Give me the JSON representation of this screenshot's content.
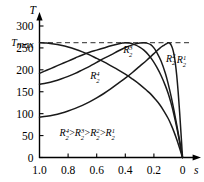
{
  "chart_data": {
    "type": "line",
    "title": "",
    "xlabel": "s",
    "ylabel": "T",
    "xlim": [
      1.0,
      0.0
    ],
    "x_reversed": true,
    "ylim": [
      0,
      320
    ],
    "grid": false,
    "legend": "R₂⁴ > R₂³ > R₂² > R₂¹",
    "xticks": [
      "1.0",
      "0.8",
      "0.6",
      "0.4",
      "0.2",
      "0"
    ],
    "xtick_values": [
      1.0,
      0.8,
      0.6,
      0.4,
      0.2,
      0.0
    ],
    "yticks": [
      "0",
      "50",
      "100",
      "150",
      "200",
      "250",
      "300"
    ],
    "ytick_values": [
      0,
      50,
      100,
      150,
      200,
      250,
      300
    ],
    "annotations": [
      {
        "name": "tmax-line",
        "label": "T",
        "sub": "max",
        "value": 262,
        "style": "dashed-horizontal"
      }
    ],
    "series": [
      {
        "name": "R2_1",
        "label": "R",
        "sub": "2",
        "sup": "1",
        "label_x": 0.04,
        "label_y": 215,
        "points": [
          [
            1.0,
            92
          ],
          [
            0.95,
            94
          ],
          [
            0.9,
            97
          ],
          [
            0.85,
            101
          ],
          [
            0.8,
            106
          ],
          [
            0.75,
            112
          ],
          [
            0.7,
            119
          ],
          [
            0.65,
            127
          ],
          [
            0.6,
            136
          ],
          [
            0.55,
            146
          ],
          [
            0.5,
            157
          ],
          [
            0.45,
            169
          ],
          [
            0.4,
            181
          ],
          [
            0.35,
            194
          ],
          [
            0.3,
            208
          ],
          [
            0.25,
            222
          ],
          [
            0.2,
            237
          ],
          [
            0.16,
            249
          ],
          [
            0.13,
            256
          ],
          [
            0.11,
            260
          ],
          [
            0.1,
            262
          ],
          [
            0.09,
            261
          ],
          [
            0.08,
            257
          ],
          [
            0.07,
            249
          ],
          [
            0.06,
            236
          ],
          [
            0.05,
            215
          ],
          [
            0.04,
            186
          ],
          [
            0.03,
            148
          ],
          [
            0.02,
            103
          ],
          [
            0.01,
            53
          ],
          [
            0.0,
            0
          ]
        ]
      },
      {
        "name": "R2_2",
        "label": "R",
        "sub": "2",
        "sup": "2",
        "label_x": 0.115,
        "label_y": 218,
        "points": [
          [
            1.0,
            167
          ],
          [
            0.95,
            170
          ],
          [
            0.9,
            174
          ],
          [
            0.85,
            179
          ],
          [
            0.8,
            185
          ],
          [
            0.75,
            192
          ],
          [
            0.7,
            200
          ],
          [
            0.65,
            208
          ],
          [
            0.6,
            217
          ],
          [
            0.55,
            226
          ],
          [
            0.5,
            234
          ],
          [
            0.45,
            243
          ],
          [
            0.4,
            251
          ],
          [
            0.35,
            257
          ],
          [
            0.3,
            261
          ],
          [
            0.27,
            262
          ],
          [
            0.25,
            261
          ],
          [
            0.22,
            257
          ],
          [
            0.2,
            250
          ],
          [
            0.18,
            240
          ],
          [
            0.15,
            220
          ],
          [
            0.12,
            192
          ],
          [
            0.1,
            168
          ],
          [
            0.08,
            140
          ],
          [
            0.06,
            108
          ],
          [
            0.04,
            74
          ],
          [
            0.02,
            38
          ],
          [
            0.0,
            0
          ]
        ]
      },
      {
        "name": "R2_3",
        "label": "R",
        "sub": "2",
        "sup": "3",
        "label_x": 0.415,
        "label_y": 238,
        "points": [
          [
            1.0,
            192
          ],
          [
            0.95,
            199
          ],
          [
            0.9,
            206
          ],
          [
            0.85,
            213
          ],
          [
            0.8,
            220
          ],
          [
            0.75,
            227
          ],
          [
            0.7,
            234
          ],
          [
            0.65,
            240
          ],
          [
            0.6,
            245
          ],
          [
            0.55,
            250
          ],
          [
            0.5,
            255
          ],
          [
            0.45,
            259
          ],
          [
            0.42,
            261
          ],
          [
            0.4,
            262
          ],
          [
            0.37,
            261
          ],
          [
            0.34,
            258
          ],
          [
            0.3,
            252
          ],
          [
            0.27,
            245
          ],
          [
            0.24,
            235
          ],
          [
            0.21,
            222
          ],
          [
            0.18,
            206
          ],
          [
            0.15,
            187
          ],
          [
            0.12,
            164
          ],
          [
            0.1,
            146
          ],
          [
            0.08,
            124
          ],
          [
            0.06,
            98
          ],
          [
            0.04,
            68
          ],
          [
            0.02,
            35
          ],
          [
            0.0,
            0
          ]
        ]
      },
      {
        "name": "R2_4",
        "label": "R",
        "sub": "2",
        "sup": "4",
        "label_x": 0.645,
        "label_y": 178,
        "points": [
          [
            1.0,
            262
          ],
          [
            0.95,
            261
          ],
          [
            0.9,
            259
          ],
          [
            0.85,
            256
          ],
          [
            0.8,
            252
          ],
          [
            0.75,
            247
          ],
          [
            0.7,
            241
          ],
          [
            0.65,
            234
          ],
          [
            0.6,
            226
          ],
          [
            0.55,
            218
          ],
          [
            0.5,
            209
          ],
          [
            0.45,
            200
          ],
          [
            0.4,
            190
          ],
          [
            0.35,
            179
          ],
          [
            0.3,
            167
          ],
          [
            0.25,
            153
          ],
          [
            0.22,
            144
          ],
          [
            0.19,
            133
          ],
          [
            0.16,
            121
          ],
          [
            0.13,
            106
          ],
          [
            0.1,
            89
          ],
          [
            0.08,
            75
          ],
          [
            0.06,
            59
          ],
          [
            0.04,
            41
          ],
          [
            0.02,
            21
          ],
          [
            0.0,
            0
          ]
        ]
      }
    ],
    "colors": {
      "axis": "#000000",
      "curve": "#1a1a1a",
      "dashed": "#555555",
      "background": "#ffffff"
    }
  }
}
